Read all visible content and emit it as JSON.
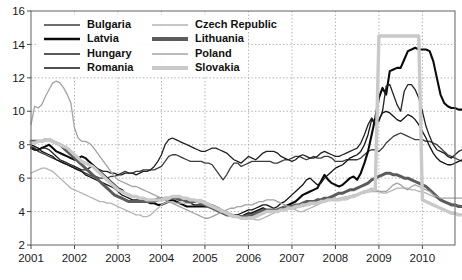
{
  "chart_data": {
    "type": "line",
    "title": "",
    "subtitle": "",
    "xlabel": "",
    "ylabel": "",
    "xlim": [
      2001,
      2010.75
    ],
    "ylim": [
      2,
      16
    ],
    "yticks": [
      2,
      4,
      6,
      8,
      10,
      12,
      14,
      16
    ],
    "xticks": [
      2001,
      2002,
      2003,
      2004,
      2005,
      2006,
      2007,
      2008,
      2009,
      2010
    ],
    "grid": true,
    "legend_position": "top-left",
    "x_step": 0.0833333,
    "series": [
      {
        "name": "Bulgaria",
        "color": "#3d3d3d",
        "width": 1.3,
        "values": [
          7.9,
          7.8,
          7.6,
          7.5,
          7.4,
          7.3,
          7.2,
          7.1,
          7.0,
          6.9,
          6.8,
          6.7,
          6.6,
          6.5,
          6.4,
          6.3,
          6.2,
          6.1,
          6.1,
          6.0,
          6.0,
          6.0,
          6.1,
          6.1,
          6.2,
          6.3,
          6.4,
          6.3,
          6.3,
          6.4,
          6.4,
          6.5,
          6.5,
          6.5,
          6.5,
          6.6,
          6.7,
          7.0,
          7.3,
          7.4,
          7.4,
          7.3,
          7.2,
          7.1,
          7.0,
          7.0,
          7.0,
          7.0,
          6.9,
          6.9,
          6.8,
          6.5,
          6.2,
          5.9,
          6.2,
          6.6,
          6.9,
          6.9,
          6.7,
          6.8,
          6.9,
          7.0,
          7.0,
          7.0,
          7.0,
          7.0,
          7.0,
          6.9,
          6.9,
          7.0,
          7.1,
          7.1,
          7.2,
          7.3,
          7.3,
          7.2,
          7.1,
          7.2,
          7.3,
          7.2,
          7.2,
          7.3,
          7.3,
          7.2,
          7.0,
          7.0,
          7.0,
          7.1,
          7.1,
          7.1,
          7.1,
          7.2,
          7.4,
          7.6,
          7.7,
          7.7,
          7.6,
          7.8,
          8.1,
          8.3,
          8.5,
          8.6,
          8.7,
          8.6,
          8.5,
          8.4,
          8.3,
          8.3,
          8.3,
          8.2,
          8.2,
          8.1,
          8.0,
          7.8,
          7.6,
          7.4,
          7.3,
          7.2,
          7.1,
          7.0
        ]
      },
      {
        "name": "Latvia",
        "color": "#0a0a0a",
        "width": 2.1,
        "values": [
          7.8,
          7.7,
          7.7,
          7.8,
          7.9,
          8.0,
          7.8,
          7.6,
          7.5,
          7.4,
          7.3,
          7.2,
          7.1,
          7.2,
          7.3,
          7.2,
          7.0,
          6.8,
          6.6,
          6.4,
          6.2,
          6.0,
          5.8,
          5.6,
          5.4,
          5.3,
          5.1,
          5.0,
          4.9,
          4.9,
          4.8,
          4.7,
          4.6,
          4.5,
          4.5,
          4.4,
          4.4,
          4.5,
          4.6,
          4.7,
          4.6,
          4.5,
          4.4,
          4.3,
          4.3,
          4.3,
          4.3,
          4.3,
          4.3,
          4.3,
          4.3,
          4.2,
          4.1,
          4.0,
          3.9,
          3.8,
          3.7,
          3.7,
          3.7,
          3.8,
          3.9,
          3.9,
          4.0,
          4.1,
          4.2,
          4.1,
          4.0,
          4.0,
          4.1,
          4.2,
          4.3,
          4.4,
          4.5,
          4.6,
          4.8,
          5.0,
          5.1,
          5.2,
          5.3,
          5.4,
          5.8,
          6.2,
          5.9,
          5.7,
          5.6,
          5.5,
          5.6,
          5.8,
          6.0,
          6.1,
          5.9,
          6.3,
          6.9,
          7.6,
          8.6,
          9.6,
          10.8,
          11.4,
          11.0,
          12.4,
          12.5,
          12.6,
          12.6,
          13.1,
          13.6,
          13.7,
          13.8,
          13.7,
          13.7,
          13.7,
          13.6,
          13.0,
          12.0,
          11.0,
          10.5,
          10.3,
          10.2,
          10.2,
          10.1,
          10.1
        ]
      },
      {
        "name": "Hungary",
        "color": "#222222",
        "width": 1.3,
        "values": [
          7.8,
          7.7,
          7.7,
          7.8,
          7.8,
          7.7,
          7.5,
          7.3,
          7.1,
          7.0,
          6.9,
          6.8,
          6.7,
          6.6,
          6.5,
          6.5,
          6.6,
          6.7,
          6.6,
          6.5,
          6.4,
          6.4,
          6.3,
          6.3,
          6.2,
          6.2,
          6.3,
          6.3,
          6.3,
          6.2,
          6.3,
          6.4,
          6.4,
          6.5,
          6.7,
          7.0,
          7.4,
          8.0,
          8.3,
          8.4,
          8.3,
          8.2,
          8.1,
          8.0,
          7.9,
          7.8,
          7.7,
          7.6,
          7.6,
          7.7,
          7.8,
          7.8,
          7.7,
          7.6,
          7.5,
          7.3,
          7.1,
          7.0,
          6.9,
          7.1,
          7.3,
          7.2,
          7.1,
          7.3,
          7.5,
          7.6,
          7.6,
          7.6,
          7.5,
          7.3,
          7.2,
          7.1,
          7.0,
          7.1,
          7.3,
          7.4,
          7.3,
          7.2,
          7.2,
          7.3,
          7.5,
          7.6,
          7.5,
          7.4,
          7.3,
          7.3,
          7.4,
          7.5,
          7.6,
          7.7,
          7.8,
          8.1,
          8.6,
          9.2,
          9.6,
          9.3,
          9.4,
          10.0,
          11.5,
          11.6,
          11.0,
          10.4,
          10.0,
          11.2,
          11.6,
          11.6,
          11.3,
          10.8,
          10.0,
          9.1,
          8.5,
          8.0,
          7.7,
          7.6,
          7.5,
          7.3,
          7.2,
          7.4,
          7.6,
          7.7
        ]
      },
      {
        "name": "Romania",
        "color": "#141414",
        "width": 1.3,
        "values": [
          8.0,
          7.9,
          7.8,
          7.6,
          7.5,
          7.4,
          7.3,
          7.1,
          7.0,
          6.9,
          6.8,
          6.7,
          6.6,
          6.5,
          6.4,
          6.2,
          6.1,
          6.0,
          5.9,
          5.8,
          5.7,
          5.6,
          5.5,
          5.4,
          5.2,
          5.0,
          4.9,
          4.8,
          4.7,
          4.7,
          4.7,
          4.7,
          4.7,
          4.7,
          4.7,
          4.8,
          4.8,
          4.8,
          4.8,
          4.8,
          4.8,
          4.8,
          4.7,
          4.6,
          4.5,
          4.4,
          4.4,
          4.4,
          4.4,
          4.4,
          4.4,
          4.3,
          4.2,
          4.0,
          3.9,
          3.8,
          3.8,
          3.8,
          3.9,
          4.0,
          4.1,
          4.1,
          4.2,
          4.3,
          4.4,
          4.4,
          4.3,
          4.2,
          4.3,
          4.5,
          4.6,
          4.8,
          5.0,
          5.2,
          5.4,
          5.6,
          5.9,
          6.0,
          5.8,
          5.6,
          5.7,
          6.0,
          6.2,
          6.4,
          6.6,
          6.7,
          6.8,
          7.0,
          7.2,
          7.3,
          7.4,
          7.6,
          8.0,
          8.6,
          9.5,
          9.2,
          9.5,
          9.9,
          10.0,
          9.9,
          9.7,
          9.5,
          9.4,
          9.6,
          9.8,
          9.7,
          9.5,
          9.2,
          8.8,
          8.4,
          7.9,
          7.5,
          7.2,
          7.0,
          6.9,
          6.8,
          6.8,
          6.9,
          7.0,
          7.1
        ]
      },
      {
        "name": "Czech Republic",
        "color": "#b4b4b4",
        "width": 1.3,
        "values": [
          6.3,
          6.4,
          6.5,
          6.6,
          6.6,
          6.5,
          6.4,
          6.2,
          6.0,
          5.8,
          5.6,
          5.4,
          5.3,
          5.2,
          5.1,
          5.0,
          4.9,
          4.8,
          4.7,
          4.6,
          4.6,
          4.5,
          4.5,
          4.4,
          4.3,
          4.2,
          4.1,
          4.0,
          3.9,
          3.8,
          3.8,
          3.7,
          3.7,
          3.8,
          4.0,
          4.2,
          4.4,
          4.5,
          4.6,
          4.6,
          4.5,
          4.5,
          4.5,
          4.5,
          4.5,
          4.6,
          4.7,
          4.7,
          4.6,
          4.5,
          4.4,
          4.3,
          4.2,
          4.1,
          4.0,
          3.9,
          3.8,
          3.7,
          3.6,
          3.6,
          3.6,
          3.6,
          3.5,
          3.5,
          3.6,
          3.7,
          3.8,
          3.9,
          4.1,
          4.2,
          4.3,
          4.3,
          4.2,
          4.1,
          4.0,
          4.0,
          4.1,
          4.2,
          4.3,
          4.4,
          4.5,
          4.6,
          4.7,
          4.8,
          4.8,
          4.7,
          4.7,
          4.7,
          4.8,
          4.9,
          5.0,
          5.1,
          5.2,
          5.3,
          5.4,
          5.3,
          5.2,
          5.1,
          5.1,
          5.2,
          5.3,
          5.4,
          5.4,
          5.4,
          5.4,
          5.3,
          5.3,
          5.2,
          5.2,
          5.1,
          5.0,
          4.9,
          4.8,
          4.7,
          4.6,
          4.5,
          4.5,
          4.4,
          4.4,
          4.3
        ]
      },
      {
        "name": "Lithuania",
        "color": "#5c5c5c",
        "width": 3.0,
        "values": [
          8.2,
          8.2,
          8.2,
          8.2,
          8.3,
          8.3,
          8.2,
          8.1,
          8.0,
          7.8,
          7.6,
          7.4,
          7.2,
          7.0,
          6.8,
          6.6,
          6.4,
          6.2,
          6.0,
          5.8,
          5.6,
          5.4,
          5.2,
          5.0,
          4.9,
          4.8,
          4.7,
          4.6,
          4.6,
          4.6,
          4.6,
          4.6,
          4.6,
          4.6,
          4.6,
          4.7,
          4.7,
          4.8,
          4.8,
          4.8,
          4.8,
          4.7,
          4.7,
          4.6,
          4.6,
          4.6,
          4.6,
          4.5,
          4.4,
          4.3,
          4.2,
          4.1,
          4.0,
          3.9,
          3.8,
          3.8,
          3.7,
          3.7,
          3.7,
          3.7,
          3.8,
          3.8,
          3.9,
          4.0,
          4.1,
          4.1,
          4.1,
          4.1,
          4.1,
          4.2,
          4.2,
          4.3,
          4.3,
          4.4,
          4.4,
          4.5,
          4.6,
          4.6,
          4.6,
          4.7,
          4.7,
          4.8,
          4.8,
          4.9,
          5.0,
          5.1,
          5.1,
          5.2,
          5.3,
          5.3,
          5.4,
          5.5,
          5.6,
          5.7,
          5.9,
          6.0,
          6.1,
          6.2,
          6.3,
          6.3,
          6.2,
          6.2,
          6.1,
          6.0,
          6.0,
          5.9,
          5.8,
          5.7,
          5.6,
          5.5,
          5.3,
          5.1,
          4.9,
          4.7,
          4.6,
          4.5,
          4.4,
          4.4,
          4.3,
          4.3
        ]
      },
      {
        "name": "Poland",
        "color": "#a3a3a3",
        "width": 1.3,
        "values": [
          9.2,
          10.3,
          10.2,
          10.4,
          10.9,
          11.3,
          11.7,
          11.8,
          11.7,
          11.4,
          11.0,
          10.5,
          9.0,
          8.4,
          8.2,
          8.2,
          8.1,
          7.9,
          7.6,
          7.3,
          7.0,
          6.7,
          6.4,
          6.1,
          5.9,
          5.8,
          5.7,
          5.6,
          5.5,
          5.5,
          5.4,
          5.3,
          5.2,
          5.1,
          5.0,
          4.9,
          4.8,
          4.7,
          4.6,
          4.5,
          4.4,
          4.3,
          4.2,
          4.1,
          4.0,
          3.9,
          3.8,
          3.7,
          3.6,
          3.6,
          3.7,
          3.8,
          3.9,
          4.0,
          4.1,
          4.2,
          4.2,
          4.3,
          4.3,
          4.4,
          4.4,
          4.4,
          4.5,
          4.6,
          4.6,
          4.7,
          4.7,
          4.7,
          4.6,
          4.5,
          4.4,
          4.3,
          4.2,
          4.2,
          4.3,
          4.3,
          4.4,
          4.4,
          4.5,
          4.5,
          4.6,
          4.6,
          4.7,
          4.7,
          4.7,
          4.8,
          4.8,
          4.9,
          4.9,
          5.0,
          5.0,
          5.1,
          5.1,
          5.2,
          5.2,
          5.2,
          5.2,
          5.2,
          5.2,
          5.4,
          5.6,
          5.7,
          5.6,
          5.4,
          5.3,
          5.5,
          5.6,
          5.5,
          5.4,
          5.3,
          5.2,
          5.0,
          4.9,
          4.8,
          4.8,
          4.8,
          4.8,
          4.8,
          4.8,
          4.8
        ]
      },
      {
        "name": "Slovakia",
        "color": "#c9c9c9",
        "width": 3.4,
        "values": [
          8.1,
          8.1,
          8.2,
          8.2,
          8.3,
          8.3,
          8.2,
          8.1,
          8.0,
          7.9,
          7.8,
          7.6,
          7.4,
          7.2,
          7.0,
          6.9,
          6.8,
          6.7,
          6.5,
          6.3,
          6.1,
          5.9,
          5.7,
          5.5,
          5.3,
          5.2,
          5.1,
          5.0,
          4.9,
          4.9,
          4.8,
          4.8,
          4.7,
          4.7,
          4.7,
          4.7,
          4.7,
          4.8,
          4.8,
          4.9,
          4.9,
          4.9,
          4.8,
          4.8,
          4.7,
          4.7,
          4.6,
          4.6,
          4.5,
          4.4,
          4.3,
          4.2,
          4.1,
          4.0,
          3.9,
          3.8,
          3.7,
          3.7,
          3.6,
          3.6,
          3.6,
          3.6,
          3.7,
          3.8,
          3.9,
          4.0,
          4.0,
          4.0,
          4.0,
          4.1,
          4.1,
          4.2,
          4.2,
          4.3,
          4.3,
          4.4,
          4.4,
          4.5,
          4.5,
          4.5,
          4.6,
          4.6,
          4.7,
          4.7,
          4.7,
          4.7,
          4.8,
          4.8,
          4.9,
          4.9,
          5.0,
          5.1,
          5.2,
          5.2,
          5.3,
          5.3,
          14.5,
          14.5,
          14.5,
          14.5,
          14.5,
          14.5,
          14.5,
          14.5,
          14.5,
          14.5,
          14.5,
          14.5,
          4.7,
          4.6,
          4.5,
          4.4,
          4.3,
          4.2,
          4.1,
          4.0,
          3.9,
          3.9,
          3.8,
          3.8
        ]
      }
    ]
  },
  "legend": {
    "entries": [
      {
        "label": "Bulgaria",
        "swatch_color": "#3d3d3d",
        "swatch_width": 1.6
      },
      {
        "label": "Czech Republic",
        "swatch_color": "#b4b4b4",
        "swatch_width": 1.6
      },
      {
        "label": "Latvia",
        "swatch_color": "#0a0a0a",
        "swatch_width": 2.6
      },
      {
        "label": "Lithuania",
        "swatch_color": "#5c5c5c",
        "swatch_width": 4.2
      },
      {
        "label": "Hungary",
        "swatch_color": "#222222",
        "swatch_width": 1.6
      },
      {
        "label": "Poland",
        "swatch_color": "#a3a3a3",
        "swatch_width": 1.6
      },
      {
        "label": "Romania",
        "swatch_color": "#141414",
        "swatch_width": 1.6
      },
      {
        "label": "Slovakia",
        "swatch_color": "#c9c9c9",
        "swatch_width": 4.2
      }
    ]
  },
  "axes": {
    "y_tick_labels": [
      "16",
      "14",
      "12",
      "10",
      "8",
      "6",
      "4",
      "2"
    ],
    "x_tick_labels": [
      "2001",
      "2002",
      "2003",
      "2004",
      "2005",
      "2006",
      "2007",
      "2008",
      "2009",
      "2010"
    ]
  }
}
